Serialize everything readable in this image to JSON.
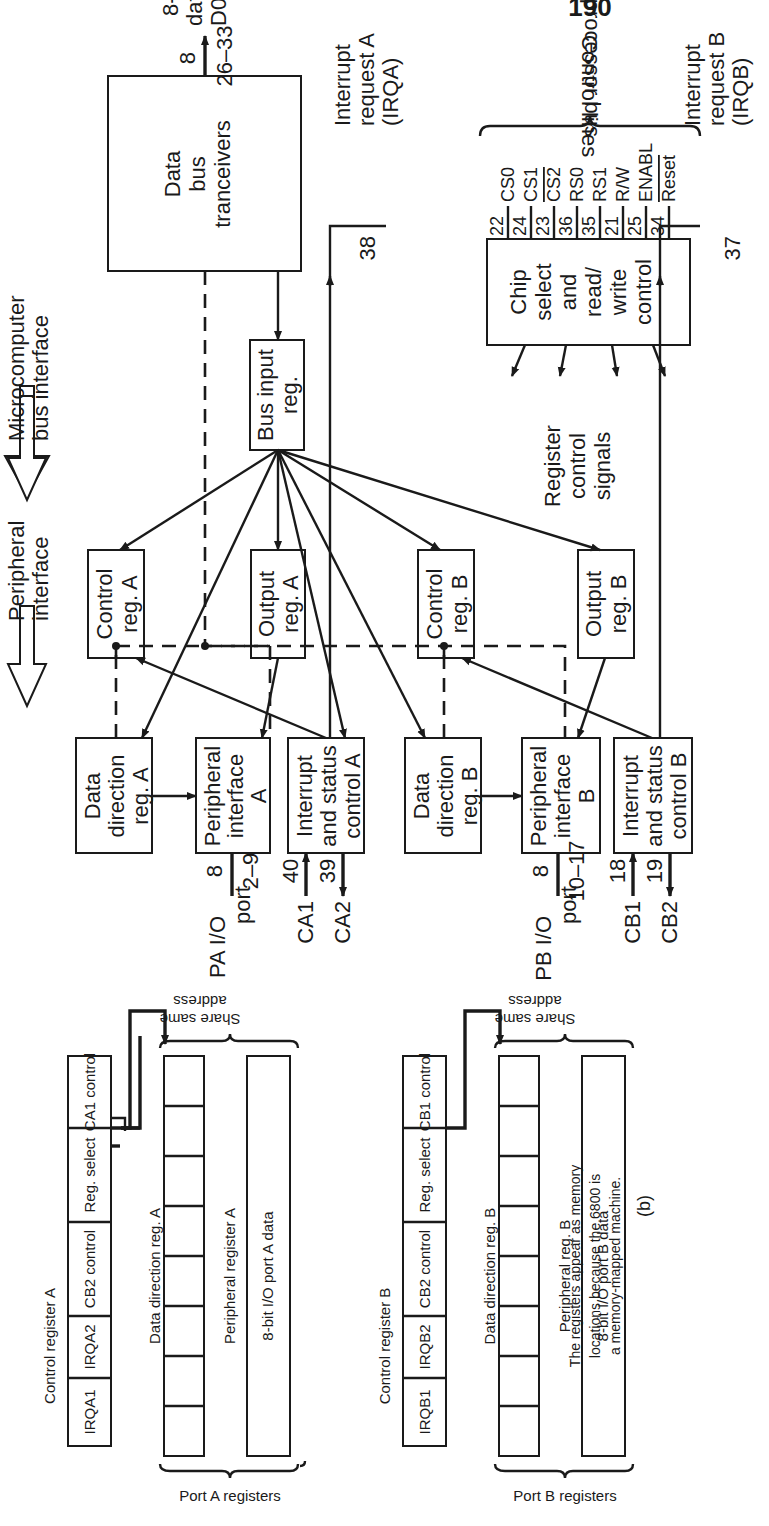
{
  "figure": {
    "part_a": {
      "side_labels": {
        "peripheral": [
          "Peripheral",
          "interface"
        ],
        "microcomputer": [
          "Microcomputer",
          "bus interface"
        ],
        "microprocessor_bus": "Microprocessor bus"
      },
      "blocks": {
        "ddr_a": [
          "Data",
          "direction",
          "reg. A"
        ],
        "pia_a": [
          "Peripheral",
          "interface",
          "A"
        ],
        "isc_a": [
          "Interrupt",
          "and status",
          "control A"
        ],
        "ctrl_a": [
          "Control",
          "reg. A"
        ],
        "out_a": [
          "Output",
          "reg. A"
        ],
        "ddr_b": [
          "Data",
          "direction",
          "reg. B"
        ],
        "pia_b": [
          "Peripheral",
          "interface",
          "B"
        ],
        "isc_b": [
          "Interrupt",
          "and status",
          "control B"
        ],
        "ctrl_b": [
          "Control",
          "reg. B"
        ],
        "out_b": [
          "Output",
          "reg. B"
        ],
        "bus_in": [
          "Bus input",
          "reg."
        ],
        "tranceivers": [
          "Data",
          "bus",
          "tranceivers"
        ],
        "chip_select": [
          "Chip",
          "select",
          "and",
          "read/",
          "write",
          "control"
        ]
      },
      "ports": {
        "pa": {
          "width": "8",
          "pins": "2–9",
          "label": [
            "PA I/O",
            "port"
          ]
        },
        "ca1": {
          "pin": "40",
          "label": "CA1"
        },
        "ca2": {
          "pin": "39",
          "label": "CA2"
        },
        "pb": {
          "width": "8",
          "pins": "10–17",
          "label": [
            "PB I/O",
            "port"
          ]
        },
        "cb1": {
          "pin": "18",
          "label": "CB1"
        },
        "cb2": {
          "pin": "19",
          "label": "CB2"
        }
      },
      "data_bus": {
        "width": "8",
        "pins": "26–33",
        "label": [
          "8-bit",
          "data bus",
          "D0–D7"
        ]
      },
      "irq_a": {
        "pin": "38",
        "label": [
          "Interrupt",
          "request A",
          "(IRQA)"
        ]
      },
      "irq_b": {
        "pin": "37",
        "label": [
          "Interrupt",
          "request B",
          "(IRQB)"
        ]
      },
      "register_control_signals": [
        "Register",
        "control",
        "signals"
      ],
      "control_lines": {
        "brace_label": "Control lines",
        "lines": [
          {
            "name": "CS0",
            "pin": "22"
          },
          {
            "name": "CS1",
            "pin": "24"
          },
          {
            "name": "CS2",
            "pin": "23",
            "overbar": true
          },
          {
            "name": "RS0",
            "pin": "36"
          },
          {
            "name": "RS1",
            "pin": "35"
          },
          {
            "name": "R/W",
            "pin": "21"
          },
          {
            "name": "ENABL",
            "pin": "25"
          },
          {
            "name": "Reset",
            "pin": "34",
            "overbar": true
          }
        ]
      }
    },
    "part_b": {
      "port_a": {
        "title": "Control register A",
        "bits": [
          "IRQA1",
          "IRQA2",
          "CB2 control",
          "Reg. select",
          "CA1 control"
        ],
        "ddr_label": "Data direction reg. A",
        "peripheral_label": "Peripheral register A",
        "data_label": "8-bit I/O port A data",
        "brace_label": "Port A registers",
        "share_label": [
          "Share same",
          "address"
        ]
      },
      "port_b": {
        "title": "Control register B",
        "bits": [
          "IRQB1",
          "IRQB2",
          "CB2 control",
          "Reg. select",
          "CB1 control"
        ],
        "ddr_label": "Data direction reg. B",
        "peripheral_label": "Peripheral reg. B",
        "data_label": "8-bit I/O port B data",
        "brace_label": "Port B registers",
        "share_label": [
          "Share same",
          "address"
        ]
      },
      "caption": [
        "The registers appear as memory",
        "locations because the 6800 is",
        "a memory-mapped machine."
      ],
      "part_label": "(b)"
    },
    "page_number": "190"
  }
}
